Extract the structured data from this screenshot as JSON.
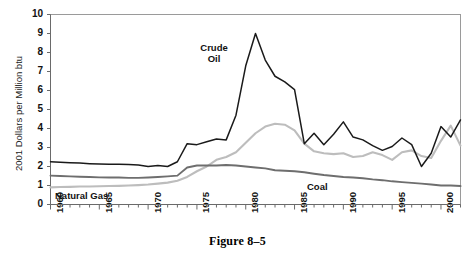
{
  "figure": {
    "caption": "Figure 8–5",
    "clipped_header": ""
  },
  "axes": {
    "y_title": "2001 Dollars per Million btu",
    "y_ticks": [
      "0",
      "1",
      "2",
      "3",
      "4",
      "5",
      "6",
      "7",
      "8",
      "9",
      "10"
    ],
    "x_ticks": [
      "1960",
      "1965",
      "1970",
      "1975",
      "1980",
      "1985",
      "1990",
      "1995",
      "2000"
    ]
  },
  "annotations": {
    "crude_oil": "Crude\nOil",
    "crude_oil_line1": "Crude",
    "crude_oil_line2": "Oil",
    "natural_gas": "Natural Gas",
    "coal": "Coal"
  },
  "colors": {
    "crude_oil": "#1a1a1a",
    "natural_gas": "#bdbdbd",
    "coal": "#6e6e6e",
    "frame": "#9a9a9a",
    "axis": "#6a6a6a",
    "background": "#ffffff"
  },
  "chart_data": {
    "type": "line",
    "title": "",
    "xlabel": "",
    "ylabel": "2001 Dollars per Million btu",
    "xlim": [
      1960,
      2002
    ],
    "ylim": [
      0,
      10
    ],
    "grid": false,
    "legend": "inline-annotations",
    "x": [
      1960,
      1961,
      1962,
      1963,
      1964,
      1965,
      1966,
      1967,
      1968,
      1969,
      1970,
      1971,
      1972,
      1973,
      1974,
      1975,
      1976,
      1977,
      1978,
      1979,
      1980,
      1981,
      1982,
      1983,
      1984,
      1985,
      1986,
      1987,
      1988,
      1989,
      1990,
      1991,
      1992,
      1993,
      1994,
      1995,
      1996,
      1997,
      1998,
      1999,
      2000,
      2001,
      2002
    ],
    "series": [
      {
        "name": "Crude Oil",
        "color": "#1a1a1a",
        "values": [
          2.25,
          2.22,
          2.2,
          2.18,
          2.15,
          2.13,
          2.12,
          2.12,
          2.1,
          2.08,
          2.0,
          2.05,
          2.0,
          2.25,
          3.2,
          3.15,
          3.3,
          3.45,
          3.4,
          4.7,
          7.3,
          9.0,
          7.6,
          6.75,
          6.45,
          6.05,
          3.2,
          3.75,
          3.15,
          3.7,
          4.35,
          3.55,
          3.4,
          3.1,
          2.85,
          3.05,
          3.5,
          3.15,
          2.0,
          2.7,
          4.1,
          3.55,
          4.45
        ]
      },
      {
        "name": "Natural Gas",
        "color": "#bdbdbd",
        "values": [
          0.9,
          0.92,
          0.93,
          0.95,
          0.95,
          0.96,
          0.97,
          0.98,
          1.0,
          1.02,
          1.05,
          1.1,
          1.15,
          1.25,
          1.45,
          1.75,
          2.0,
          2.35,
          2.5,
          2.75,
          3.25,
          3.75,
          4.1,
          4.25,
          4.2,
          3.9,
          3.2,
          2.8,
          2.7,
          2.65,
          2.7,
          2.5,
          2.55,
          2.75,
          2.6,
          2.35,
          2.75,
          2.85,
          2.55,
          2.45,
          3.35,
          4.15,
          3.1
        ]
      },
      {
        "name": "Coal",
        "color": "#6e6e6e",
        "values": [
          1.52,
          1.5,
          1.48,
          1.46,
          1.45,
          1.43,
          1.42,
          1.42,
          1.4,
          1.4,
          1.42,
          1.45,
          1.48,
          1.52,
          1.95,
          2.05,
          2.05,
          2.05,
          2.08,
          2.05,
          2.0,
          1.95,
          1.9,
          1.8,
          1.78,
          1.75,
          1.7,
          1.62,
          1.55,
          1.5,
          1.45,
          1.42,
          1.38,
          1.32,
          1.28,
          1.22,
          1.18,
          1.14,
          1.1,
          1.05,
          1.0,
          1.0,
          0.97
        ]
      }
    ]
  }
}
